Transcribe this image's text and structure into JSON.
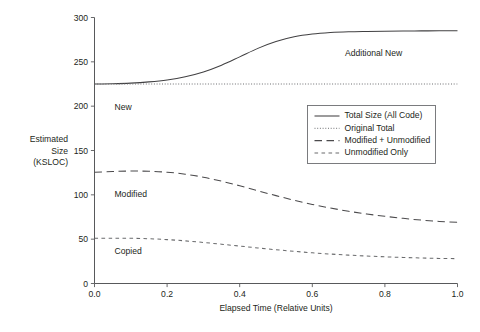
{
  "chart_data": {
    "type": "line",
    "title": "",
    "xlabel": "Elapsed Time (Relative Units)",
    "ylabel": "Estimated Size (KSLOC)",
    "ylabel_lines": [
      "Estimated",
      "Size",
      "(KSLOC)"
    ],
    "xlim": [
      0.0,
      1.0
    ],
    "ylim": [
      0,
      300
    ],
    "xticks": [
      0.0,
      0.2,
      0.4,
      0.6,
      0.8,
      1.0
    ],
    "xtick_labels": [
      "0.0",
      "0.2",
      "0.4",
      "0.6",
      "0.8",
      "1.0"
    ],
    "yticks": [
      0,
      50,
      100,
      150,
      200,
      250,
      300
    ],
    "ytick_labels": [
      "0",
      "50",
      "100",
      "150",
      "200",
      "250",
      "300"
    ],
    "grid": false,
    "legend_position": "center-right-upper",
    "x": [
      0.0,
      0.05,
      0.1,
      0.15,
      0.2,
      0.25,
      0.3,
      0.35,
      0.4,
      0.45,
      0.5,
      0.55,
      0.6,
      0.65,
      0.7,
      0.75,
      0.8,
      0.85,
      0.9,
      0.95,
      1.0
    ],
    "series": [
      {
        "name": "Total Size (All Code)",
        "style": "solid",
        "values": [
          225,
          225.3,
          226,
          227.4,
          229.6,
          233.2,
          238.6,
          246.2,
          255.6,
          265.2,
          272.9,
          278.2,
          281.3,
          283.0,
          283.9,
          284.3,
          284.6,
          284.8,
          284.9,
          285.0,
          285.0
        ]
      },
      {
        "name": "Original Total",
        "style": "dotted",
        "values": [
          225,
          225,
          225,
          225,
          225,
          225,
          225,
          225,
          225,
          225,
          225,
          225,
          225,
          225,
          225,
          225,
          225,
          225,
          225,
          225,
          225
        ]
      },
      {
        "name": "Modified + Unmodified",
        "style": "long-dash",
        "values": [
          125.5,
          126.3,
          126.8,
          126.6,
          125.5,
          123.3,
          119.9,
          115.4,
          110.2,
          104.6,
          99.1,
          93.9,
          89.2,
          85.1,
          81.5,
          78.4,
          75.8,
          73.5,
          71.5,
          70.0,
          69.0
        ]
      },
      {
        "name": "Unmodified Only",
        "style": "short-dash",
        "values": [
          51.0,
          51.1,
          51.0,
          50.5,
          49.5,
          48.1,
          46.3,
          44.3,
          42.2,
          40.1,
          38.1,
          36.3,
          34.6,
          33.2,
          32.0,
          31.0,
          30.1,
          29.4,
          28.8,
          28.3,
          28.0
        ]
      }
    ],
    "annotations": [
      {
        "text": "Additional New",
        "x": 0.69,
        "y": 257
      },
      {
        "text": "New",
        "x": 0.055,
        "y": 196
      },
      {
        "text": "Modified",
        "x": 0.055,
        "y": 98
      },
      {
        "text": "Copied",
        "x": 0.055,
        "y": 33
      }
    ]
  },
  "legend": {
    "entries": [
      {
        "label": "Total Size (All Code)",
        "style": "solid"
      },
      {
        "label": "Original Total",
        "style": "dotted"
      },
      {
        "label": "Modified + Unmodified",
        "style": "long-dash"
      },
      {
        "label": "Unmodified Only",
        "style": "short-dash"
      }
    ]
  },
  "colors": {
    "curve": "#414042",
    "axis": "#58595b",
    "text": "#231f20",
    "background": "#ffffff"
  }
}
